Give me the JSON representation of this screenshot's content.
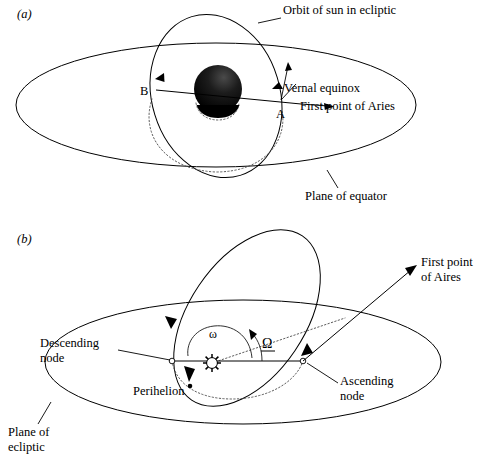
{
  "figure": {
    "kind": "astronomy-diagram",
    "background": "#ffffff",
    "ink": "#000000"
  },
  "panel_a": {
    "label": "(a)",
    "annotations": {
      "orbit": "Orbit of sun in ecliptic",
      "vernal_equinox": "Vernal equinox",
      "first_point": "First point of Aries",
      "plane": "Plane of equator",
      "node_a": "A",
      "node_b": "B"
    }
  },
  "panel_b": {
    "label": "(b)",
    "annotations": {
      "first_point": "First point",
      "first_point_2": "of Aires",
      "descending": "Descending",
      "descending_2": "node",
      "ascending": "Ascending",
      "ascending_2": "node",
      "perihelion": "Perihelion",
      "plane": "Plane of",
      "plane_2": "ecliptic",
      "arg_perihelion": "ω",
      "raan": "Ω"
    }
  }
}
